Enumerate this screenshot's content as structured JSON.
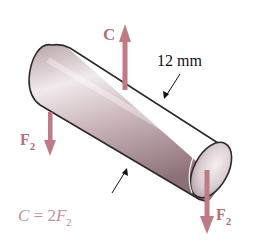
{
  "figure": {
    "colors": {
      "force_arrow": "#c07a84",
      "force_label": "#b5707a",
      "equation_text": "#c98e96",
      "cylinder_light": "#ece4e6",
      "cylinder_mid": "#c9b3b8",
      "cylinder_dark": "#8f7379",
      "outline": "#2a2a2a",
      "background": "#ffffff"
    },
    "forces": [
      {
        "id": "C",
        "label": "C",
        "subscript": "",
        "direction": "up"
      },
      {
        "id": "F2_left",
        "label": "F",
        "subscript": "2",
        "direction": "down"
      },
      {
        "id": "F2_right",
        "label": "F",
        "subscript": "2",
        "direction": "down"
      }
    ],
    "dimension": {
      "label": "12 mm",
      "meaning": "diameter"
    },
    "equation": {
      "lhs": "C",
      "eq": " = 2",
      "var": "F",
      "sub": "2"
    }
  }
}
